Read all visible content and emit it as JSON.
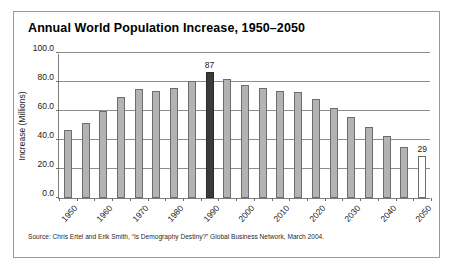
{
  "figure": {
    "title": "Annual World Population Increase, 1950–2050",
    "source_note": "Source: Chris Ertel and Erik Smith, “Is Demography Destiny?” Global Business Network, March 2004.",
    "border_color": "#9a9a9a"
  },
  "chart_data": {
    "type": "bar",
    "title": "Annual World Population Increase, 1950–2050",
    "xlabel": "",
    "ylabel": "Increase (Millions)",
    "ylim": [
      0,
      100
    ],
    "ytick_labels": [
      "100.0",
      "80.0",
      "60.0",
      "40.0",
      "20.0",
      "0.0"
    ],
    "ytick_values": [
      100,
      80,
      60,
      40,
      20,
      0
    ],
    "grid": "horizontal",
    "legend": "none",
    "xtick_labels": [
      "1950",
      "1960",
      "1970",
      "1980",
      "1990",
      "2000",
      "2010",
      "2020",
      "2030",
      "2040",
      "2050"
    ],
    "categories": [
      "1950",
      "1955",
      "1960",
      "1965",
      "1970",
      "1975",
      "1980",
      "1985",
      "1990",
      "1995",
      "2000",
      "2005",
      "2010",
      "2015",
      "2020",
      "2025",
      "2030",
      "2035",
      "2040",
      "2045",
      "2050"
    ],
    "values": [
      47,
      52,
      60,
      70,
      75,
      74,
      76,
      81,
      87,
      82,
      78,
      76,
      74,
      73,
      68,
      62,
      56,
      49,
      43,
      35,
      29
    ],
    "bar_styles": [
      "filled",
      "filled",
      "filled",
      "filled",
      "filled",
      "filled",
      "filled",
      "filled",
      "highlight",
      "filled",
      "filled",
      "filled",
      "filled",
      "filled",
      "filled",
      "filled",
      "filled",
      "filled",
      "filled",
      "filled",
      "open"
    ],
    "annotations": [
      {
        "category": "1990",
        "value": 87,
        "text": "87"
      },
      {
        "category": "2050",
        "value": 29,
        "text": "29"
      }
    ],
    "colors": {
      "bar_fill": "#b3b3b3",
      "bar_edge": "#6d6d6d",
      "highlight_fill": "#3b3b3b",
      "open_fill": "#ffffff",
      "gridline": "#8d8d8d",
      "axis": "#7d7d7d"
    }
  }
}
